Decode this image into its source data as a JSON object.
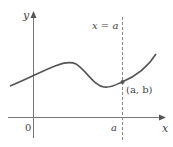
{
  "diagram": {
    "type": "function-graph",
    "axes": {
      "x_label": "x",
      "y_label": "y",
      "origin_label": "0",
      "x_tick_label": "a"
    },
    "vertical_line": {
      "label": "x = a",
      "style": "dashed"
    },
    "point": {
      "label": "(a, b)"
    },
    "colors": {
      "curve": "#555555",
      "axes": "#666666",
      "dashed_line": "#888888",
      "point": "#555555",
      "text": "#444444"
    }
  }
}
